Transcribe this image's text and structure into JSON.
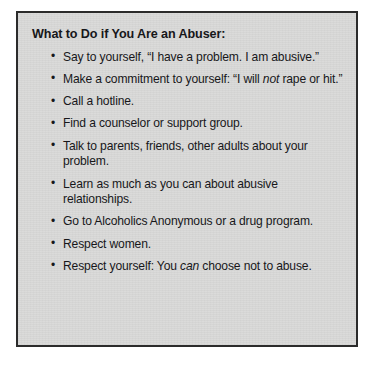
{
  "box": {
    "title": "What to Do if You Are an Abuser:",
    "background_color": "#d9d9d8",
    "border_color": "#2b2b2b",
    "text_color": "#17171a",
    "page_background_color": "#ffffff"
  },
  "advice_items": [
    {
      "prefix": "Say to yourself, “I have a problem. I am abusive.”",
      "emphasis": "",
      "suffix": ""
    },
    {
      "prefix": "Make a commitment to yourself: “I will ",
      "emphasis": "not",
      "suffix": " rape or hit.”"
    },
    {
      "prefix": "Call a hotline.",
      "emphasis": "",
      "suffix": ""
    },
    {
      "prefix": "Find a counselor or support group.",
      "emphasis": "",
      "suffix": ""
    },
    {
      "prefix": "Talk to parents, friends, other adults about your problem.",
      "emphasis": "",
      "suffix": ""
    },
    {
      "prefix": "Learn as much as you can about abusive relationships.",
      "emphasis": "",
      "suffix": ""
    },
    {
      "prefix": "Go to Alcoholics Anonymous or a drug program.",
      "emphasis": "",
      "suffix": ""
    },
    {
      "prefix": "Respect women.",
      "emphasis": "",
      "suffix": ""
    },
    {
      "prefix": "Respect yourself: You ",
      "emphasis": "can",
      "suffix": " choose not to abuse."
    }
  ]
}
